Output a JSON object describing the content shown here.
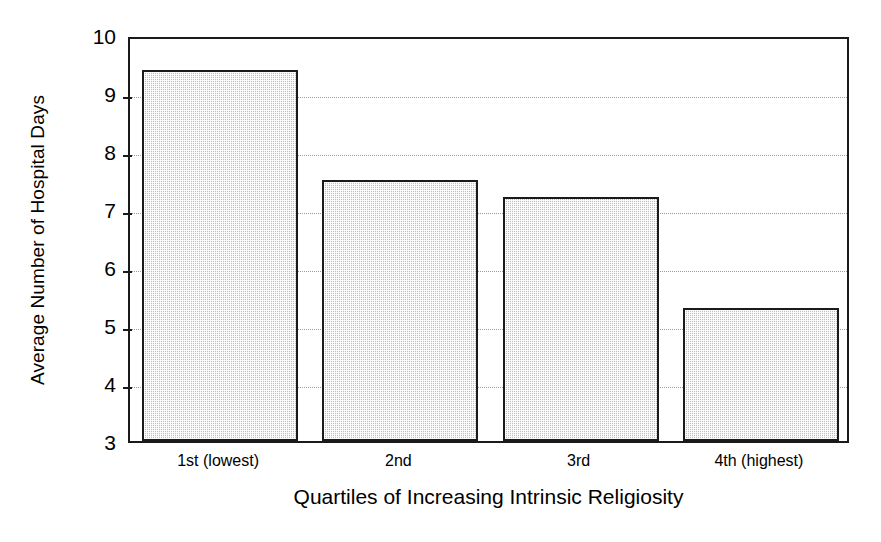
{
  "chart_data": {
    "type": "bar",
    "title": "",
    "xlabel": "Quartiles of Increasing Intrinsic Religiosity",
    "ylabel": "Average Number of Hospital Days",
    "categories": [
      "1st (lowest)",
      "2nd",
      "3rd",
      "4th (highest)"
    ],
    "values": [
      9.4,
      7.5,
      7.2,
      5.3
    ],
    "ylim": [
      3,
      10
    ],
    "yticks": [
      3,
      4,
      5,
      6,
      7,
      8,
      9,
      10
    ],
    "ytick_labels": [
      "3",
      "4",
      "5",
      "6",
      "7",
      "8",
      "9",
      "10"
    ],
    "grid": true,
    "grid_axis": "y",
    "legend": false,
    "legend_position": "none",
    "bar_fill_color": "#dcdcdc",
    "bar_edge_color": "#1a1a1a",
    "axis_color": "#1a1a1a",
    "gridline_color": "#9a9a9a",
    "background_color": "#ffffff"
  }
}
